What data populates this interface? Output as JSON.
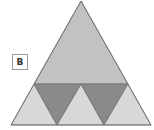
{
  "figure": {
    "label": "B",
    "colors": {
      "top_region": "#c2c2c2",
      "dark_triangles": "#8a8a8a",
      "light_triangles": "#d8d8d8",
      "outline": "#6e6e6e"
    },
    "shapes": {
      "outer_triangle": [
        [
          81,
          1
        ],
        [
          11,
          125
        ],
        [
          151,
          125
        ]
      ],
      "top_region": [
        [
          81,
          1
        ],
        [
          34,
          84
        ],
        [
          128,
          84
        ]
      ],
      "light_triangle_left": [
        [
          34,
          84
        ],
        [
          11,
          125
        ],
        [
          57,
          125
        ]
      ],
      "dark_triangle_left": [
        [
          34,
          84
        ],
        [
          81,
          84
        ],
        [
          57,
          125
        ]
      ],
      "light_triangle_middle": [
        [
          81,
          84
        ],
        [
          57,
          125
        ],
        [
          104,
          125
        ]
      ],
      "dark_triangle_right": [
        [
          81,
          84
        ],
        [
          128,
          84
        ],
        [
          104,
          125
        ]
      ],
      "light_triangle_right": [
        [
          128,
          84
        ],
        [
          104,
          125
        ],
        [
          151,
          125
        ]
      ]
    }
  }
}
